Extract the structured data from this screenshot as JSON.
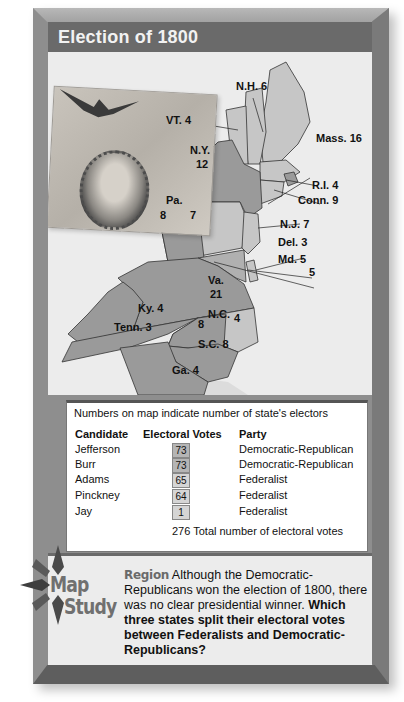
{
  "title": "Election of 1800",
  "map": {
    "state_labels": [
      {
        "state": "N.H.",
        "electors": "6",
        "label": "N.H. 6"
      },
      {
        "state": "VT.",
        "electors": "4",
        "label": "VT. 4"
      },
      {
        "state": "Mass.",
        "electors": "16",
        "label": "Mass. 16"
      },
      {
        "state": "N.Y.",
        "electors": "12",
        "label_line1": "N.Y.",
        "label_line2": "12"
      },
      {
        "state": "R.I.",
        "electors": "4",
        "label": "R.I. 4"
      },
      {
        "state": "Conn.",
        "electors": "9",
        "label": "Conn. 9"
      },
      {
        "state": "Pa.",
        "split": [
          "8",
          "7"
        ],
        "label": "Pa.",
        "left": "8",
        "right": "7"
      },
      {
        "state": "N.J.",
        "electors": "7",
        "label": "N.J. 7"
      },
      {
        "state": "Del.",
        "electors": "3",
        "label": "Del. 3"
      },
      {
        "state": "Md.",
        "split": [
          "5",
          "5"
        ],
        "label": "Md. 5",
        "second": "5"
      },
      {
        "state": "Va.",
        "electors": "21",
        "label_line1": "Va.",
        "label_line2": "21"
      },
      {
        "state": "Ky.",
        "electors": "4",
        "label": "Ky. 4"
      },
      {
        "state": "Tenn.",
        "electors": "3",
        "label": "Tenn. 3"
      },
      {
        "state": "N.C.",
        "split": [
          "8",
          "4"
        ],
        "label": "N.C.",
        "left": "8",
        "right": "4"
      },
      {
        "state": "S.C.",
        "electors": "8",
        "label": "S.C. 8"
      },
      {
        "state": "Ga.",
        "electors": "4",
        "label": "Ga. 4"
      }
    ],
    "colors": {
      "dem_rep_dark": "#9a9a9a",
      "federalist_light": "#c6c6c6",
      "water": "#ececec",
      "border": "#333333"
    }
  },
  "legend": {
    "note": "Numbers on map indicate number of state's electors",
    "headers": {
      "candidate": "Candidate",
      "votes": "Electoral Votes",
      "party": "Party"
    },
    "rows": [
      {
        "candidate": "Jefferson",
        "votes": "73",
        "party": "Democratic-Republican"
      },
      {
        "candidate": "Burr",
        "votes": "73",
        "party": "Democratic-Republican"
      },
      {
        "candidate": "Adams",
        "votes": "65",
        "party": "Federalist"
      },
      {
        "candidate": "Pinckney",
        "votes": "64",
        "party": "Federalist"
      },
      {
        "candidate": "Jay",
        "votes": "1",
        "party": "Federalist"
      }
    ],
    "total": "276 Total number of electoral votes"
  },
  "map_study": {
    "logo_word1": "Map",
    "logo_word2": "Study",
    "region_label": "Region",
    "body": " Although the Democratic-Republicans won the election of 1800, there was no clear presidential winner. ",
    "question": "Which three states split their electoral votes between Federalists and Democratic-Republicans?"
  }
}
